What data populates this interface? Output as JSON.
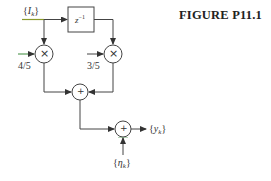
{
  "figure": {
    "title": "FIGURE P11.1"
  },
  "diagram": {
    "input_signal": {
      "brace_open": "{",
      "symbol": "I",
      "subscript": "k",
      "brace_close": "}"
    },
    "delay_block": {
      "label": "z",
      "exponent": "−1"
    },
    "gain_left": {
      "label": "4/5"
    },
    "gain_right": {
      "label": "3/5"
    },
    "multiplier_symbol": "×",
    "adder_symbol": "+",
    "noise_signal": {
      "brace_open": "{",
      "symbol": "η",
      "subscript": "k",
      "brace_close": "}"
    },
    "output_signal": {
      "brace_open": "{",
      "symbol": "y",
      "subscript": "k",
      "brace_close": "}"
    },
    "colors": {
      "line": "#444444",
      "input_accent": "#8a9a2a",
      "gain_accent": "#3a8a3a",
      "noise_accent": "#3a8a3a"
    }
  }
}
